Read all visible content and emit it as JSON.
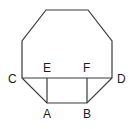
{
  "figure": {
    "kind": "geometry-diagram",
    "background_color": "#ffffff",
    "stroke_color": "#3a3a3a",
    "stroke_width": 1.2,
    "label_color": "#1b1b1b",
    "canvas": {
      "width": 135,
      "height": 129
    },
    "labels": {
      "A": "A",
      "B": "B",
      "C": "C",
      "D": "D",
      "E": "E",
      "F": "F"
    },
    "points": {
      "A": {
        "x": 47,
        "y": 103
      },
      "B": {
        "x": 87,
        "y": 103
      },
      "C": {
        "x": 22,
        "y": 78
      },
      "D": {
        "x": 112,
        "y": 78
      },
      "E": {
        "x": 47,
        "y": 78
      },
      "F": {
        "x": 87,
        "y": 78
      }
    },
    "octagon": {
      "name": "octagon",
      "vertices": [
        {
          "x": 46,
          "y": 10
        },
        {
          "x": 88,
          "y": 10
        },
        {
          "x": 112,
          "y": 41
        },
        {
          "x": 112,
          "y": 78
        },
        {
          "x": 87,
          "y": 103
        },
        {
          "x": 47,
          "y": 103
        },
        {
          "x": 22,
          "y": 78
        },
        {
          "x": 22,
          "y": 41
        }
      ]
    },
    "rectangle": {
      "name": "rectangle-ABFE",
      "vertices": [
        {
          "x": 47,
          "y": 78
        },
        {
          "x": 87,
          "y": 78
        },
        {
          "x": 87,
          "y": 103
        },
        {
          "x": 47,
          "y": 103
        }
      ]
    },
    "chord_CD": {
      "name": "chord-C-D",
      "from": {
        "x": 22,
        "y": 78
      },
      "to": {
        "x": 112,
        "y": 78
      }
    }
  }
}
